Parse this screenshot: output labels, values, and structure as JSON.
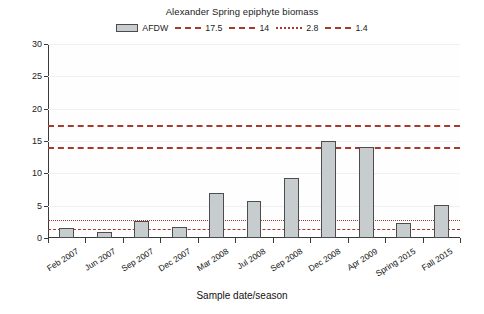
{
  "chart_data": {
    "type": "bar",
    "title": "Alexander Spring epiphyte biomass",
    "xlabel": "Sample date/season",
    "ylabel": "Ash-free dry weight (g/m²)",
    "ylabel_main": "Ash-free dry weight (g/m",
    "ylabel_sup": "2",
    "ylabel_tail": ")",
    "categories": [
      "Feb 2007",
      "Jun 2007",
      "Sep 2007",
      "Dec 2007",
      "Mar 2008",
      "Jul 2008",
      "Sep 2008",
      "Dec 2008",
      "Apr 2009",
      "Spring 2015",
      "Fall 2015"
    ],
    "values": [
      1.5,
      0.9,
      2.6,
      1.7,
      7.0,
      5.7,
      9.3,
      15.0,
      14.0,
      2.3,
      5.1
    ],
    "series_name": "AFDW",
    "ylim": [
      0,
      30
    ],
    "yticks": [
      0,
      5,
      10,
      15,
      20,
      25,
      30
    ],
    "ytick_labels": [
      "0",
      "5",
      "10",
      "15",
      "20",
      "25",
      "30"
    ],
    "grid": true,
    "legend_position": "top-center",
    "bar_color": "#c7cccf",
    "bar_edge_color": "#4d4d4d",
    "reference_line_color": "#a8392b",
    "reference_lines": [
      {
        "label": "17.5",
        "value": 17.5,
        "style": "dashdot"
      },
      {
        "label": "14",
        "value": 14.0,
        "style": "dash"
      },
      {
        "label": "2.8",
        "value": 2.8,
        "style": "dot"
      },
      {
        "label": "1.4",
        "value": 1.4,
        "style": "dash"
      }
    ],
    "annotations": []
  },
  "legend": {
    "bar_entry_label": "AFDW",
    "entries": [
      {
        "label": "17.5",
        "style": "dashdot"
      },
      {
        "label": "14",
        "style": "dash"
      },
      {
        "label": "2.8",
        "style": "dot"
      },
      {
        "label": "1.4",
        "style": "dash"
      }
    ]
  }
}
